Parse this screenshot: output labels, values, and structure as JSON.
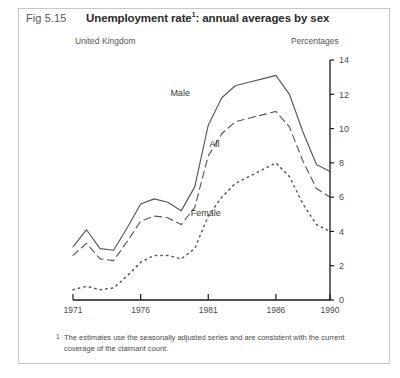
{
  "figure": {
    "number": "Fig 5.15",
    "title": "Unemployment rate",
    "title_superscript": "1",
    "title_rest": ": annual averages by sex",
    "region": "United Kingdom",
    "units": "Percentages",
    "footnote_marker": "1",
    "footnote": "The estimates use the seasonally adjusted series and are consistent with the current coverage of the claimant count."
  },
  "chart_data": {
    "type": "line",
    "subtitle": "United Kingdom",
    "xlabel": "",
    "ylabel": "Percentages",
    "xlim": [
      1971,
      1990
    ],
    "ylim": [
      0,
      14
    ],
    "yticks": [
      0,
      2,
      4,
      6,
      8,
      10,
      12,
      14
    ],
    "ytick_labels": [
      "0",
      "2",
      "4",
      "6",
      "8",
      "10",
      "12",
      "14"
    ],
    "xticks": [
      1971,
      1976,
      1981,
      1986,
      1990
    ],
    "xtick_labels": [
      "1971",
      "1976",
      "1981",
      "1986",
      "1990"
    ],
    "grid": false,
    "legend_position": "inline-labels",
    "x": [
      1971,
      1972,
      1973,
      1974,
      1975,
      1976,
      1977,
      1978,
      1979,
      1980,
      1981,
      1982,
      1983,
      1984,
      1985,
      1986,
      1987,
      1988,
      1989,
      1990
    ],
    "series": [
      {
        "name": "Male",
        "style": "solid",
        "label_position": {
          "x": 1978.2,
          "y": 11.9
        },
        "values": [
          3.1,
          4.1,
          3.0,
          2.9,
          4.2,
          5.6,
          5.9,
          5.7,
          5.2,
          6.6,
          10.2,
          11.8,
          12.5,
          12.7,
          12.9,
          13.1,
          12.0,
          9.8,
          7.9,
          7.5
        ]
      },
      {
        "name": "All",
        "style": "dashed",
        "label_position": {
          "x": 1981.1,
          "y": 8.9
        },
        "values": [
          2.6,
          3.3,
          2.4,
          2.3,
          3.4,
          4.6,
          4.9,
          4.8,
          4.4,
          5.4,
          8.4,
          9.7,
          10.4,
          10.6,
          10.8,
          11.0,
          10.1,
          8.1,
          6.5,
          6.0
        ]
      },
      {
        "name": "Female",
        "style": "dotted",
        "label_position": {
          "x": 1979.7,
          "y": 4.9
        },
        "values": [
          0.6,
          0.8,
          0.6,
          0.7,
          1.4,
          2.2,
          2.6,
          2.6,
          2.4,
          3.0,
          4.9,
          6.0,
          6.8,
          7.2,
          7.6,
          8.0,
          7.2,
          5.6,
          4.4,
          4.0
        ]
      }
    ]
  }
}
